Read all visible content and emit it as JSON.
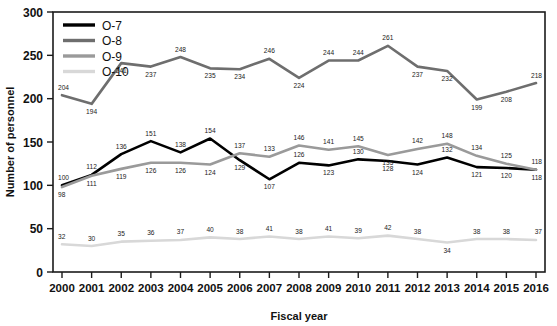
{
  "chart_data": {
    "type": "line",
    "title": "",
    "xlabel": "Fiscal year",
    "ylabel": "Number of personnel",
    "categories": [
      "2000",
      "2001",
      "2002",
      "2003",
      "2004",
      "2005",
      "2006",
      "2007",
      "2008",
      "2009",
      "2010",
      "2011",
      "2012",
      "2013",
      "2014",
      "2015",
      "2016"
    ],
    "ylim": [
      0,
      300
    ],
    "yticks": [
      0,
      50,
      100,
      150,
      200,
      250,
      300
    ],
    "grid": false,
    "legend_position": "top-left",
    "series": [
      {
        "name": "O-7",
        "color": "#000000",
        "values": [
          100,
          112,
          136,
          151,
          138,
          154,
          129,
          107,
          126,
          123,
          130,
          128,
          124,
          132,
          121,
          120,
          118
        ]
      },
      {
        "name": "O-8",
        "color": "#6e6e6e",
        "values": [
          204,
          194,
          241,
          237,
          248,
          235,
          234,
          246,
          224,
          244,
          244,
          261,
          237,
          232,
          199,
          208,
          218
        ]
      },
      {
        "name": "O-9",
        "color": "#9a9a9a",
        "values": [
          98,
          111,
          119,
          126,
          126,
          124,
          137,
          133,
          146,
          141,
          145,
          135,
          142,
          148,
          134,
          125,
          118
        ]
      },
      {
        "name": "O-10",
        "color": "#d8d8d8",
        "values": [
          32,
          30,
          35,
          36,
          37,
          40,
          38,
          41,
          38,
          41,
          39,
          42,
          38,
          34,
          38,
          38,
          37
        ]
      }
    ],
    "label_offsets": {
      "O-7": [
        "above-left",
        "above",
        "above",
        "above",
        "above",
        "above",
        "below",
        "below",
        "above",
        "below",
        "above",
        "below",
        "below",
        "above",
        "below",
        "below",
        "above"
      ],
      "O-8": [
        "above-left",
        "below",
        "below",
        "below",
        "above",
        "below",
        "below",
        "above",
        "below",
        "above",
        "above",
        "above",
        "below",
        "below",
        "below",
        "below",
        "above"
      ],
      "O-9": [
        "below",
        "below",
        "below",
        "below",
        "below",
        "below",
        "above",
        "above",
        "above",
        "above",
        "above",
        "below",
        "above",
        "above",
        "above",
        "above",
        "below"
      ],
      "O-10": [
        "above",
        "above",
        "above",
        "above",
        "above",
        "above",
        "above",
        "above",
        "above",
        "above",
        "above",
        "above",
        "above",
        "below",
        "above",
        "above",
        "above"
      ]
    }
  },
  "legend": {
    "items": [
      {
        "label": "O-7"
      },
      {
        "label": "O-8"
      },
      {
        "label": "O-9"
      },
      {
        "label": "O-10"
      }
    ]
  }
}
